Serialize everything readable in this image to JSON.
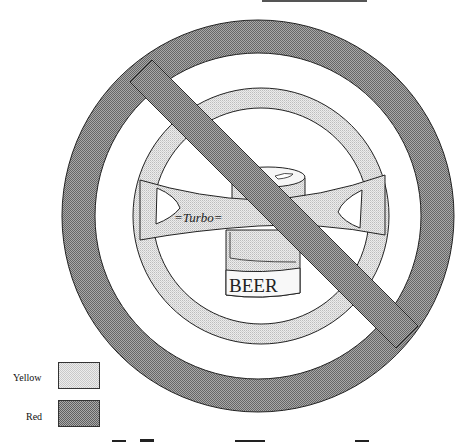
{
  "figure": {
    "can_label": "BEER",
    "wheel_label": "=Turbo=",
    "cropped_top_text": "",
    "cropped_bottom_text": ""
  },
  "legend": {
    "items": [
      {
        "label": "Yellow",
        "color": "#e6e6e6",
        "pattern": "light-dither"
      },
      {
        "label": "Red",
        "color": "#8c8c8c",
        "pattern": "dark-dither"
      }
    ]
  },
  "colors": {
    "red_fill": "#8e8e8e",
    "yellow_fill": "#dcdcdc",
    "outline": "#222222",
    "background": "#ffffff"
  }
}
